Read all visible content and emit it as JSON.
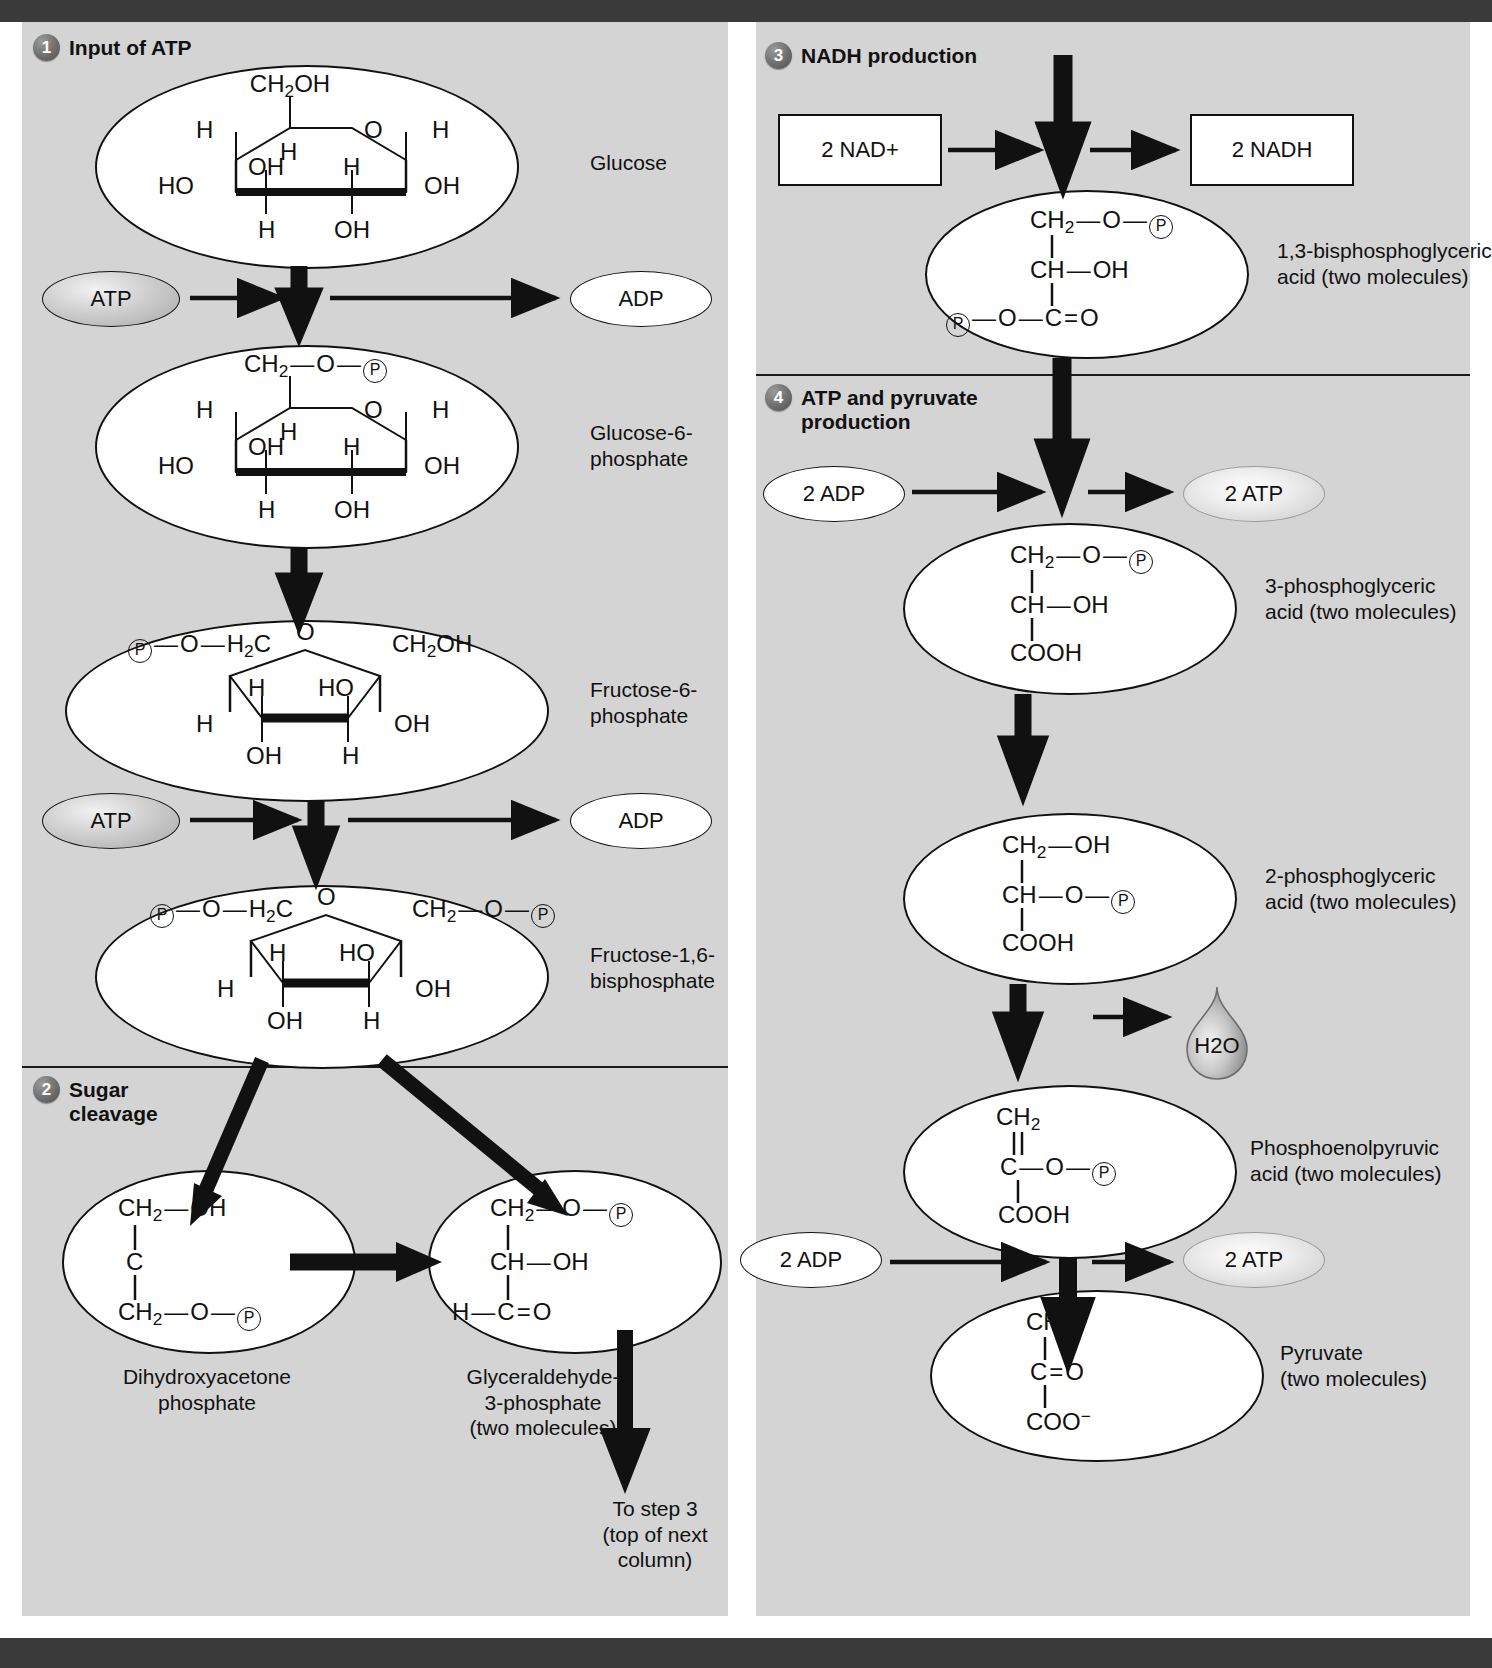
{
  "figure": {
    "background": "#d4d4d4",
    "ink": "#111111"
  },
  "steps": [
    {
      "number": "1",
      "label": "Input of ATP"
    },
    {
      "number": "2",
      "label": "Sugar\ncleavage"
    },
    {
      "number": "3",
      "label": "NADH production"
    },
    {
      "number": "4",
      "label": "ATP and pyruvate\nproduction"
    }
  ],
  "molecules": [
    {
      "id": "glucose",
      "label": "Glucose",
      "type": "haworth-pyranose",
      "atoms": {
        "c6": "CH2OH",
        "ring_o": "O",
        "h_left": "H",
        "h_right": "H",
        "h_c5": "H",
        "ho_left": "HO",
        "oh_c2": "OH",
        "h_c2": "H",
        "h_bottom": "H",
        "oh_bottom": "OH",
        "oh_right": "OH"
      }
    },
    {
      "id": "glucose-6-phosphate",
      "label": "Glucose-6-\nphosphate",
      "type": "haworth-pyranose",
      "atoms": {
        "c6": "CH2 — O — P",
        "ring_o": "O",
        "h_left": "H",
        "h_right": "H",
        "h_c5": "H",
        "ho_left": "HO",
        "oh_c2": "OH",
        "h_c2": "H",
        "h_bottom": "H",
        "oh_bottom": "OH",
        "oh_right": "OH"
      }
    },
    {
      "id": "fructose-6-phosphate",
      "label": "Fructose-6-\nphosphate",
      "type": "haworth-furanose",
      "atoms": {
        "left_arm": "P — O — H2C",
        "right_arm": "CH2OH",
        "ring_o": "O",
        "h_left_low": "H",
        "h_inner": "H",
        "ho_inner": "HO",
        "oh_right": "OH",
        "oh_bottom": "OH",
        "h_bottom": "H"
      }
    },
    {
      "id": "fructose-1-6-bisphosphate",
      "label": "Fructose-1,6-\nbisphosphate",
      "type": "haworth-furanose",
      "atoms": {
        "left_arm": "P — O — H2C",
        "right_arm": "CH2 — O — P",
        "ring_o": "O",
        "h_left_low": "H",
        "h_inner": "H",
        "ho_inner": "HO",
        "oh_right": "OH",
        "oh_bottom": "OH",
        "h_bottom": "H"
      }
    },
    {
      "id": "dihydroxyacetone-phosphate",
      "label": "Dihydroxyacetone\nphosphate",
      "type": "chain",
      "lines": [
        "CH2 — OH",
        "C",
        "CH2 — O — P"
      ]
    },
    {
      "id": "glyceraldehyde-3-phosphate",
      "label": "Glyceraldehyde-\n3-phosphate\n(two molecules)",
      "type": "chain",
      "lines": [
        "CH2 — O — P",
        "CH — OH",
        "H — C = O"
      ]
    },
    {
      "id": "1-3-bisphosphoglyceric-acid",
      "label": "1,3-bisphosphoglyceric\nacid (two molecules)",
      "type": "chain",
      "lines": [
        "CH2 — O — P",
        "CH — OH",
        "P — O — C = O"
      ]
    },
    {
      "id": "3-phosphoglyceric-acid",
      "label": "3-phosphoglyceric\nacid (two molecules)",
      "type": "chain",
      "lines": [
        "CH2 — O — P",
        "CH — OH",
        "COOH"
      ]
    },
    {
      "id": "2-phosphoglyceric-acid",
      "label": "2-phosphoglyceric\nacid (two molecules)",
      "type": "chain",
      "lines": [
        "CH2 — OH",
        "CH — O — P",
        "COOH"
      ]
    },
    {
      "id": "phosphoenolpyruvic-acid",
      "label": "Phosphoenolpyruvic\nacid (two molecules)",
      "type": "chain",
      "lines": [
        "CH2",
        "C — O — P",
        "COOH"
      ]
    },
    {
      "id": "pyruvate",
      "label": "Pyruvate\n(two molecules)",
      "type": "chain",
      "lines": [
        "CH3",
        "C = O",
        "COO-"
      ]
    }
  ],
  "cofactors": {
    "atp_1": "ATP",
    "adp_1": "ADP",
    "atp_2": "ATP",
    "adp_2": "ADP",
    "nad_plus": "2 NAD+",
    "nadh": "2 NADH",
    "adp_2x_1": "2 ADP",
    "atp_2x_1": "2 ATP",
    "adp_2x_2": "2 ADP",
    "atp_2x_2": "2 ATP",
    "water": "H2O"
  },
  "notes": {
    "to_step_3": "To step 3\n(top of next\ncolumn)"
  }
}
